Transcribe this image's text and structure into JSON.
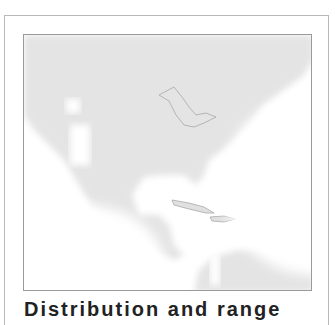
{
  "figure": {
    "type": "range-map",
    "region": "North America, Central America and Caribbean",
    "caption": "Distribution and range",
    "colors": {
      "land": "#e4e4e4",
      "range_highlight": "#ffffff",
      "border": "#9a9a9a",
      "coastline": "#b0b0b0"
    }
  }
}
